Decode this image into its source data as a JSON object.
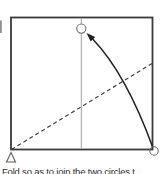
{
  "figure": {
    "caption": "Fold so as to join the two circles t"
  },
  "colors": {
    "background": "#ffffff",
    "square_border": "#3a3a3a",
    "center_line": "#a0a0a0",
    "fold_line": "#3f3f3f",
    "arrow": "#1f1f1f",
    "circle_stroke": "#6e6e6e",
    "triangle_stroke": "#5f5f5f",
    "glyph_fragment": "#8f8f8f",
    "caption_text": "#2e2e2e"
  },
  "geometry": {
    "square": {
      "x": 11,
      "y": 17.5,
      "width": 141.5,
      "height": 132,
      "stroke_width": 1.8
    },
    "center_line": {
      "x1": 81.3,
      "y1": 18.5,
      "x2": 81.3,
      "y2": 148.5,
      "stroke_width": 1
    },
    "fold_line": {
      "x1": 11.5,
      "y1": 149.5,
      "x2": 152,
      "y2": 63.5,
      "dash": "4 3",
      "stroke_width": 1.2
    },
    "arrow": {
      "path": "M 152.6 147 Q 126 74 92.9 39.3",
      "stroke_width": 1.5,
      "head_points": "86.5,33 95.2,37 90.7,41.6"
    },
    "circle_top": {
      "cx": 81.3,
      "cy": 28.6,
      "r": 4.6,
      "stroke_width": 1.1
    },
    "circle_bottom_right": {
      "cx": 154,
      "cy": 151,
      "r": 4.2,
      "stroke_width": 1.1
    },
    "corner_triangle": {
      "points": "11,152.5 6.5,162 15.5,162",
      "stroke_width": 1.1
    },
    "glyph_fragment": {
      "x": 0,
      "y": 20.5,
      "width": 1.8,
      "height": 12.5
    }
  }
}
